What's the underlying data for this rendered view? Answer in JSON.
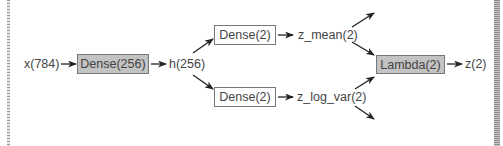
{
  "diagram": {
    "type": "network-architecture",
    "nodes": {
      "input": {
        "label": "x(784)"
      },
      "dense_hidden": {
        "label": "Dense(256)",
        "style": "filled"
      },
      "hidden": {
        "label": "h(256)"
      },
      "dense_mean": {
        "label": "Dense(2)",
        "style": "plain"
      },
      "dense_logvar": {
        "label": "Dense(2)",
        "style": "plain"
      },
      "z_mean": {
        "label": "z_mean(2)"
      },
      "z_log_var": {
        "label": "z_log_var(2)"
      },
      "lambda": {
        "label": "Lambda(2)",
        "style": "filled"
      },
      "z": {
        "label": "z(2)"
      }
    },
    "edges": [
      {
        "from": "input",
        "to": "dense_hidden"
      },
      {
        "from": "dense_hidden",
        "to": "hidden"
      },
      {
        "from": "hidden",
        "to": "dense_mean"
      },
      {
        "from": "hidden",
        "to": "dense_logvar"
      },
      {
        "from": "dense_mean",
        "to": "z_mean"
      },
      {
        "from": "dense_logvar",
        "to": "z_log_var"
      },
      {
        "from": "z_mean",
        "to": "lambda"
      },
      {
        "from": "z_log_var",
        "to": "lambda"
      },
      {
        "from": "z_mean",
        "to": "(outgoing, unlabeled)"
      },
      {
        "from": "z_log_var",
        "to": "(outgoing, unlabeled)"
      },
      {
        "from": "lambda",
        "to": "z"
      }
    ],
    "colors": {
      "box_fill": "#c3c3c3",
      "box_border": "#777777",
      "arrow": "#222222",
      "text": "#444444"
    }
  }
}
